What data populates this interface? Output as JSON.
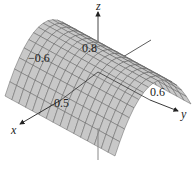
{
  "chart_data": {
    "type": "surface3d",
    "title": "",
    "function": "z = 1 - x^2 (parabolic cylinder, concave down along x, constant in y)",
    "axes": {
      "x": {
        "label": "x",
        "ticks": [
          {
            "value": -0.6,
            "label": "−0.6"
          },
          {
            "value": 0.5,
            "label": "0.5"
          }
        ]
      },
      "y": {
        "label": "y",
        "ticks": [
          {
            "value": 0.6,
            "label": "0.6"
          }
        ]
      },
      "z": {
        "label": "z",
        "ticks": [
          {
            "value": 0.8,
            "label": "0.8"
          }
        ]
      }
    },
    "x_range": [
      -1,
      1
    ],
    "y_range": [
      -1,
      1
    ],
    "grid_lines": 16,
    "colors": {
      "surface_fill": "#c8c8c8",
      "mesh_line": "#555555",
      "axis": "#333333"
    }
  },
  "labels": {
    "x_axis": "x",
    "y_axis": "y",
    "z_axis": "z",
    "tick_x_neg": "−0.6",
    "tick_x_pos": "0.5",
    "tick_y_pos": "0.6",
    "tick_z": "0.8"
  }
}
